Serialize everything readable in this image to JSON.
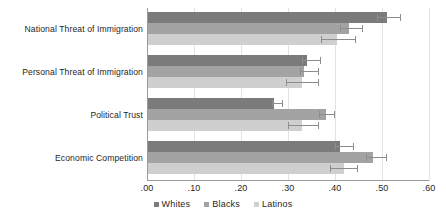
{
  "chart_data": {
    "type": "bar",
    "orientation": "horizontal",
    "title": "",
    "xlabel": "",
    "ylabel": "",
    "xlim": [
      0.0,
      0.6
    ],
    "grid": true,
    "legend_position": "bottom-center",
    "categories": [
      "National Threat of Immigration",
      "Personal Threat of Immigration",
      "Political Trust",
      "Economic Competition"
    ],
    "tick_labels": [
      ".00",
      ".10",
      ".20",
      ".30",
      ".40",
      ".50",
      ".60"
    ],
    "tick_values": [
      0.0,
      0.1,
      0.2,
      0.3,
      0.4,
      0.5,
      0.6
    ],
    "series": [
      {
        "name": "Whites",
        "color": "#7b7b7b",
        "values": [
          0.51,
          0.34,
          0.27,
          0.41
        ],
        "error_low": [
          0.49,
          0.33,
          0.265,
          0.4
        ],
        "error_high": [
          0.54,
          0.37,
          0.29,
          0.44
        ]
      },
      {
        "name": "Blacks",
        "color": "#a3a3a3",
        "values": [
          0.43,
          0.335,
          0.38,
          0.48
        ],
        "error_low": [
          0.41,
          0.325,
          0.365,
          0.465
        ],
        "error_high": [
          0.46,
          0.365,
          0.4,
          0.51
        ]
      },
      {
        "name": "Latinos",
        "color": "#cfcfcf",
        "values": [
          0.405,
          0.33,
          0.33,
          0.42
        ],
        "error_low": [
          0.37,
          0.295,
          0.3,
          0.39
        ],
        "error_high": [
          0.445,
          0.365,
          0.365,
          0.45
        ]
      }
    ]
  },
  "legend": {
    "items": [
      {
        "label": "Whites"
      },
      {
        "label": "Blacks"
      },
      {
        "label": "Latinos"
      }
    ]
  }
}
